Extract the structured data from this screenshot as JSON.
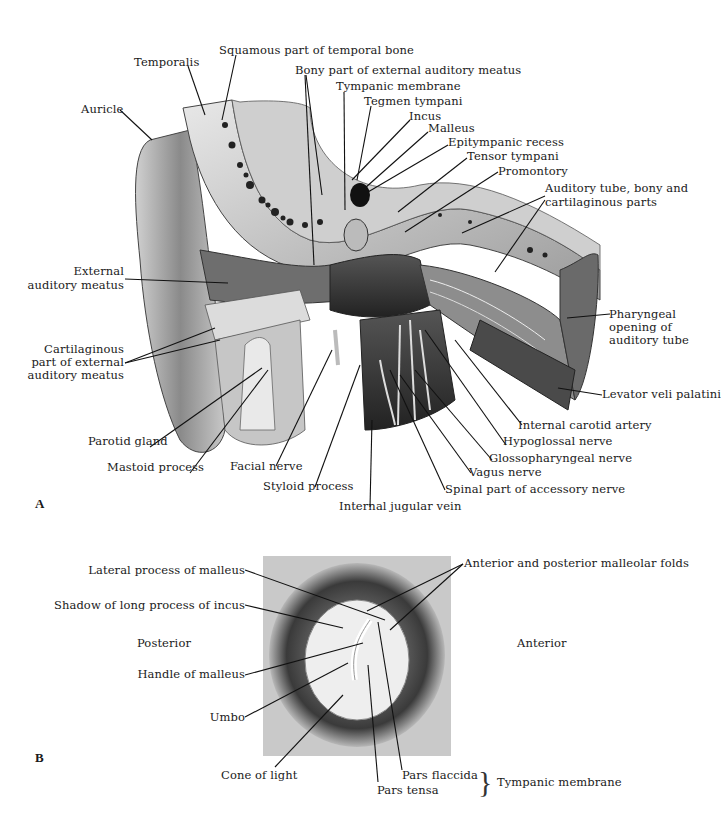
{
  "panel_a": {
    "letter": "A",
    "labels": {
      "squamous": "Squamous part of temporal bone",
      "temporalis": "Temporalis",
      "bony_part": "Bony part of external auditory meatus",
      "tympanic_membrane": "Tympanic membrane",
      "tegmen": "Tegmen tympani",
      "incus": "Incus",
      "malleus": "Malleus",
      "epitympanic": "Epitympanic recess",
      "tensor": "Tensor tympani",
      "promontory": "Promontory",
      "auditory_tube_1": "Auditory tube, bony and",
      "auditory_tube_2": "cartilaginous parts",
      "auricle": "Auricle",
      "ext_meatus_1": "External",
      "ext_meatus_2": "auditory meatus",
      "pharyngeal_1": "Pharyngeal",
      "pharyngeal_2": "opening of",
      "pharyngeal_3": "auditory tube",
      "cartilaginous_1": "Cartilaginous",
      "cartilaginous_2": "part of external",
      "cartilaginous_3": "auditory meatus",
      "levator": "Levator veli palatini",
      "internal_carotid": "Internal carotid artery",
      "hypoglossal": "Hypoglossal nerve",
      "parotid": "Parotid gland",
      "glossopharyngeal": "Glossopharyngeal nerve",
      "mastoid": "Mastoid process",
      "facial": "Facial nerve",
      "vagus": "Vagus nerve",
      "styloid": "Styloid process",
      "spinal_accessory": "Spinal part of accessory nerve",
      "jugular": "Internal jugular vein"
    }
  },
  "panel_b": {
    "letter": "B",
    "labels": {
      "lateral_process": "Lateral process of malleus",
      "shadow_incus": "Shadow of long process of incus",
      "posterior": "Posterior",
      "anterior": "Anterior",
      "handle": "Handle of malleus",
      "umbo": "Umbo",
      "malleolar_folds": "Anterior and posterior malleolar folds",
      "cone": "Cone of light",
      "pars_flaccida": "Pars flaccida",
      "pars_tensa": "Pars tensa",
      "tympanic_membrane": "Tympanic membrane"
    }
  }
}
